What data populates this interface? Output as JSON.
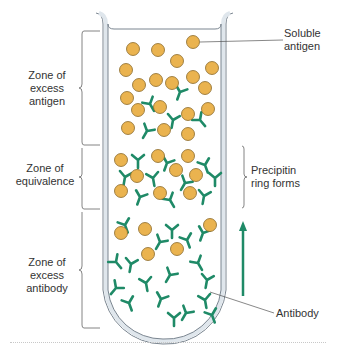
{
  "diagram": {
    "labels": {
      "soluble_antigen": "Soluble\nantigen",
      "soluble_antigen_line1": "Soluble",
      "soluble_antigen_line2": "antigen",
      "zone_excess_antigen_line1": "Zone of",
      "zone_excess_antigen_line2": "excess",
      "zone_excess_antigen_line3": "antigen",
      "zone_equivalence_line1": "Zone of",
      "zone_equivalence_line2": "equivalence",
      "zone_excess_antibody_line1": "Zone of",
      "zone_excess_antibody_line2": "excess",
      "zone_excess_antibody_line3": "antibody",
      "precipitin_line1": "Precipitin",
      "precipitin_line2": "ring forms",
      "antibody": "Antibody"
    },
    "zones": [
      {
        "name": "Zone of excess antigen",
        "y_range": [
          30,
          145
        ]
      },
      {
        "name": "Zone of equivalence",
        "y_range": [
          145,
          210
        ]
      },
      {
        "name": "Zone of excess antibody",
        "y_range": [
          210,
          328
        ]
      }
    ],
    "colors": {
      "antigen_fill": "#eab34f",
      "antigen_stroke": "#8a6a2a",
      "antibody": "#1f8a67",
      "tube_wall": "#dfe6ec",
      "tube_outline": "#7a8590",
      "bracket": "#666666",
      "arrow": "#1f8a67",
      "text": "#333333"
    },
    "antigens": [
      [
        133,
        49
      ],
      [
        158,
        50
      ],
      [
        193,
        42
      ],
      [
        126,
        70
      ],
      [
        177,
        61
      ],
      [
        212,
        68
      ],
      [
        139,
        85
      ],
      [
        156,
        80
      ],
      [
        172,
        83
      ],
      [
        193,
        77
      ],
      [
        205,
        88
      ],
      [
        127,
        98
      ],
      [
        138,
        110
      ],
      [
        160,
        107
      ],
      [
        188,
        114
      ],
      [
        208,
        109
      ],
      [
        128,
        128
      ],
      [
        164,
        130
      ],
      [
        188,
        134
      ],
      [
        121,
        160
      ],
      [
        158,
        156
      ],
      [
        188,
        156
      ],
      [
        137,
        176
      ],
      [
        176,
        170
      ],
      [
        196,
        175
      ],
      [
        121,
        191
      ],
      [
        160,
        193
      ],
      [
        190,
        193
      ],
      [
        121,
        233
      ],
      [
        145,
        229
      ],
      [
        210,
        225
      ],
      [
        148,
        254
      ],
      [
        177,
        249
      ]
    ],
    "antibodies": [
      [
        180,
        92,
        20
      ],
      [
        150,
        104,
        -30
      ],
      [
        173,
        120,
        10
      ],
      [
        200,
        120,
        -40
      ],
      [
        147,
        131,
        30
      ],
      [
        138,
        160,
        0
      ],
      [
        167,
        163,
        20
      ],
      [
        205,
        165,
        -20
      ],
      [
        125,
        177,
        10
      ],
      [
        153,
        178,
        -10
      ],
      [
        185,
        183,
        30
      ],
      [
        215,
        178,
        0
      ],
      [
        140,
        197,
        20
      ],
      [
        170,
        200,
        -30
      ],
      [
        204,
        196,
        10
      ],
      [
        125,
        225,
        -20
      ],
      [
        160,
        242,
        30
      ],
      [
        172,
        230,
        0
      ],
      [
        187,
        240,
        -20
      ],
      [
        203,
        233,
        20
      ],
      [
        131,
        264,
        10
      ],
      [
        146,
        283,
        -10
      ],
      [
        170,
        275,
        30
      ],
      [
        198,
        263,
        -30
      ],
      [
        207,
        280,
        10
      ],
      [
        129,
        303,
        -20
      ],
      [
        161,
        299,
        20
      ],
      [
        205,
        300,
        -10
      ],
      [
        174,
        318,
        0
      ],
      [
        186,
        313,
        30
      ],
      [
        212,
        315,
        -20
      ],
      [
        116,
        288,
        40
      ],
      [
        116,
        262,
        -40
      ]
    ]
  }
}
